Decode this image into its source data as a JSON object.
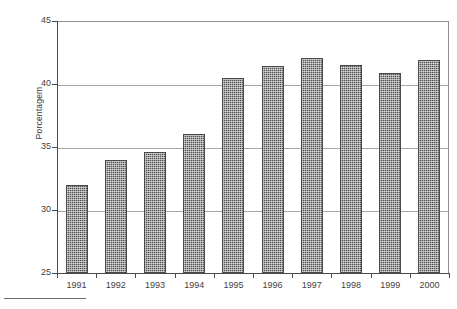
{
  "chart_data": {
    "type": "bar",
    "title": "",
    "subtitle": "",
    "xlabel": "",
    "ylabel": "Porcentagem",
    "categories": [
      "1991",
      "1992",
      "1993",
      "1994",
      "1995",
      "1996",
      "1997",
      "1998",
      "1999",
      "2000"
    ],
    "values": [
      32.0,
      34.0,
      34.6,
      36.0,
      40.5,
      41.4,
      42.1,
      41.5,
      40.9,
      41.9
    ],
    "series": [
      {
        "name": "Porcentagem",
        "values": [
          32.0,
          34.0,
          34.6,
          36.0,
          40.5,
          41.4,
          42.1,
          41.5,
          40.9,
          41.9
        ]
      }
    ],
    "ylim": [
      25,
      45
    ],
    "yticks": [
      25,
      30,
      35,
      40,
      45
    ],
    "ytick_labels": [
      "25",
      "30",
      "35",
      "40",
      "45"
    ],
    "xlim_categories": 10,
    "grid": true,
    "grid_axis": "y",
    "legend": false,
    "legend_position": "none",
    "bar_color": "#555252",
    "bar_pattern": "crosshatch-dither",
    "axis_color": "#4a4a4a",
    "gridline_color": "#a8a8a8",
    "background": "#ffffff",
    "annotations": []
  },
  "axis": {
    "y_title": "Porcentagem"
  }
}
